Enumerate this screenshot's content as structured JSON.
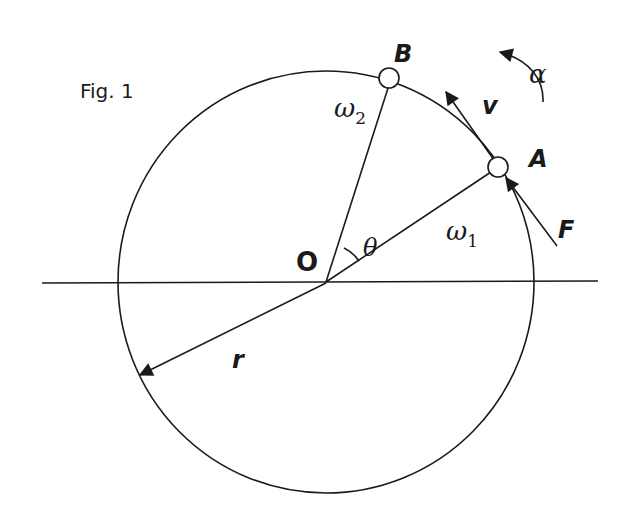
{
  "figure": {
    "title": "Fig. 1",
    "colors": {
      "ink": "#1a1a1a",
      "background": "#ffffff"
    },
    "labels": {
      "center": "O",
      "point_a": "A",
      "point_b": "B",
      "velocity": "v",
      "force": "F",
      "angular_accel": "α",
      "angle": "θ",
      "omega1_base": "ω",
      "omega1_sub": "1",
      "omega2_base": "ω",
      "omega2_sub": "2",
      "radius": "r"
    },
    "elements": {
      "circle": "circle of radius r centered at O",
      "axis": "horizontal line through O",
      "radius_oa": "radius from O to A",
      "radius_ob": "radius from O to B",
      "radius_r": "radius arrow r pointing to lower-left",
      "velocity_arrow": "tangential velocity v at A",
      "force_arrow": "force F applied at A",
      "alpha_arrow": "counter-clockwise angular acceleration α",
      "theta_arc": "angle θ between OA and OB"
    }
  }
}
